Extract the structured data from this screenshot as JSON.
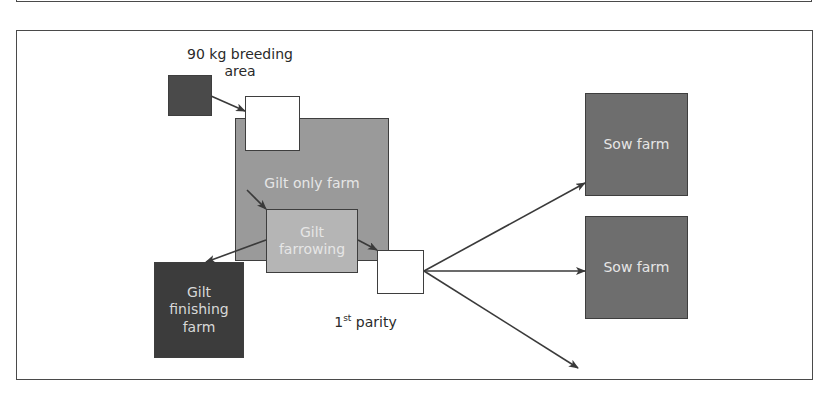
{
  "diagram": {
    "type": "flow",
    "nodes": {
      "breeding_area": {
        "label": "90 kg breeding area",
        "line1": "90 kg breeding",
        "line2": "area",
        "color": "#4a4a4a"
      },
      "entry_box": {
        "label": "",
        "color": "#ffffff"
      },
      "gilt_only_farm": {
        "label": "Gilt only farm",
        "color": "#9a9a9a"
      },
      "gilt_farrowing": {
        "label": "Gilt farrowing",
        "line1": "Gilt",
        "line2": "farrowing",
        "color": "#b5b5b5"
      },
      "gilt_finishing_farm": {
        "label": "Gilt finishing farm",
        "line1": "Gilt",
        "line2": "finishing",
        "line3": "farm",
        "color": "#3c3c3c"
      },
      "first_parity_box": {
        "label": "",
        "color": "#ffffff"
      },
      "first_parity_label": {
        "base": "1",
        "sup": "st",
        "rest": " parity"
      },
      "sow_farm_1": {
        "label": "Sow farm",
        "color": "#6e6e6e"
      },
      "sow_farm_2": {
        "label": "Sow farm",
        "color": "#6e6e6e"
      }
    },
    "edges": [
      {
        "from": "breeding_area",
        "to": "entry_box"
      },
      {
        "from": "gilt_only_farm",
        "to": "gilt_farrowing"
      },
      {
        "from": "gilt_farrowing",
        "to": "gilt_finishing_farm"
      },
      {
        "from": "gilt_farrowing",
        "to": "first_parity_box"
      },
      {
        "from": "first_parity_box",
        "to": "sow_farm_1"
      },
      {
        "from": "first_parity_box",
        "to": "sow_farm_2"
      },
      {
        "from": "first_parity_box",
        "to": "unlabeled_destination"
      }
    ],
    "line_color": "#3a3a3a"
  }
}
